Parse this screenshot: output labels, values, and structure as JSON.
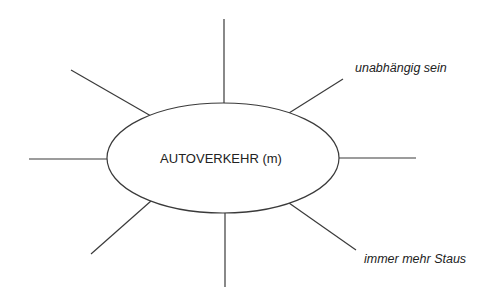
{
  "diagram": {
    "type": "mind-map",
    "center": {
      "label": "AUTOVERKEHR (m)"
    },
    "branches": [
      {
        "id": "top",
        "label": ""
      },
      {
        "id": "upper-right",
        "label": "unabhängig sein"
      },
      {
        "id": "right",
        "label": ""
      },
      {
        "id": "lower-right",
        "label": "immer mehr Staus"
      },
      {
        "id": "bottom",
        "label": ""
      },
      {
        "id": "lower-left",
        "label": ""
      },
      {
        "id": "left",
        "label": ""
      },
      {
        "id": "upper-left",
        "label": ""
      }
    ]
  },
  "colors": {
    "line": "#3a3a3a",
    "text": "#222222",
    "background": "#ffffff"
  }
}
